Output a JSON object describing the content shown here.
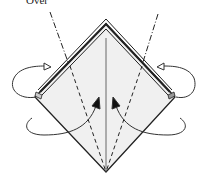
{
  "diagram": {
    "step_label": "Over",
    "colors": {
      "paper": "#f0f0f0",
      "outline": "#222222",
      "layer_band": "#999999",
      "background": "#ffffff"
    },
    "elements": [
      {
        "type": "diamond",
        "description": "square base (kite) shape"
      },
      {
        "type": "center-crease",
        "style": "solid"
      },
      {
        "type": "valley-fold-lines",
        "style": "dashed",
        "count": 2
      },
      {
        "type": "mountain-fold-lines",
        "style": "dash-dot",
        "count": 2
      },
      {
        "type": "arrows-fold-behind",
        "count": 2,
        "description": "hollow-head looping arrows"
      },
      {
        "type": "arrows-fold-in",
        "count": 2,
        "description": "solid-head curved arrows"
      }
    ]
  }
}
